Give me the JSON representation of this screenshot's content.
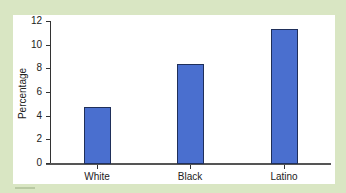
{
  "chart_data": {
    "type": "bar",
    "title": "",
    "xlabel": "",
    "ylabel": "Percentage",
    "categories": [
      "White",
      "Black",
      "Latino"
    ],
    "values": [
      4.7,
      8.4,
      11.3
    ],
    "ylim": [
      0,
      12
    ],
    "yticks": [
      0,
      2,
      4,
      6,
      8,
      10,
      12
    ],
    "grid": false,
    "legend": null,
    "colors": {
      "bar": "#4a6fcf",
      "bar_border": "#1f2f5a",
      "background": "#d9e6c3",
      "panel": "#ffffff"
    }
  },
  "labels": {
    "ylabel": "Percentage",
    "yticks": [
      "0",
      "2",
      "4",
      "6",
      "8",
      "10",
      "12"
    ],
    "categories": [
      "White",
      "Black",
      "Latino"
    ]
  }
}
